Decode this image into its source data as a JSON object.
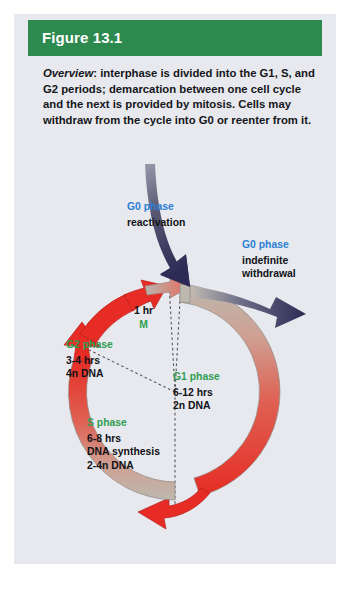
{
  "figure": {
    "header_label": "Figure 13.1",
    "header_color": "#2d8a4e",
    "panel_bg": "#e8e9ee",
    "caption_lead": "Overview",
    "caption_body": ": interphase is divided into the G1, S, and G2 periods; demarcation between one cell cycle and the next is provided by mitosis. Cells may withdraw from the cycle into G0 or reenter from it."
  },
  "diagram": {
    "type": "cell-cycle-ring",
    "colors": {
      "phase_green": "#2f9e52",
      "phase_blue": "#2b7fd4",
      "cycle_arrow_red": "#e02b26",
      "cycle_arc_gray": "#b9b5ad",
      "g0_arrow_navy": "#2b2b55",
      "text_black": "#111217"
    },
    "labels": {
      "g0_reactivation": {
        "title": "G0 phase",
        "lines": [
          "reactivation"
        ]
      },
      "g0_withdrawal": {
        "title": "G0 phase",
        "lines": [
          "indefinite",
          "withdrawal"
        ]
      },
      "g1": {
        "title": "G1 phase",
        "lines": [
          "6-12 hrs",
          "2n DNA"
        ]
      },
      "g2": {
        "title": "G2 phase",
        "lines": [
          "3-4 hrs",
          "4n DNA"
        ]
      },
      "s": {
        "title": "S phase",
        "lines": [
          "6-8 hrs",
          "DNA synthesis",
          "2-4n DNA"
        ]
      },
      "m": {
        "duration": "1 hr",
        "title": "M"
      }
    }
  }
}
